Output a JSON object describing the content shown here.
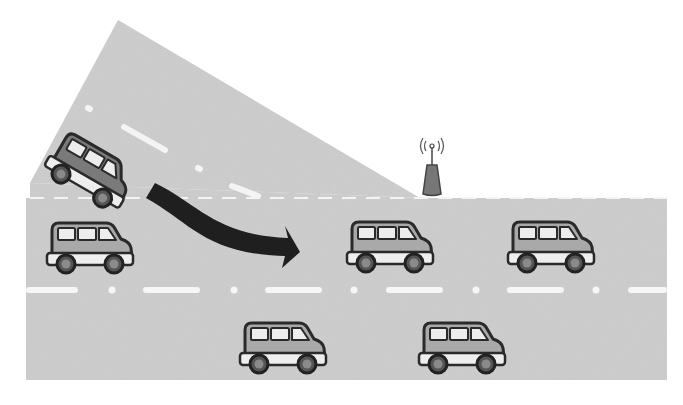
{
  "diagram": {
    "colors": {
      "background": "#ffffff",
      "road": "#cfcfcf",
      "lane_marking": "#f4f4f4",
      "car_body": "#a9a9a9",
      "merging_car_body": "#7a7a7a",
      "car_outline": "#2a2a2a",
      "car_window": "#ededed",
      "car_bumper": "#eeeeee",
      "wheel": "#555555",
      "arrow": "#1f1f1f",
      "antenna_base": "#777777"
    },
    "elements": {
      "highway": {
        "label": "highway",
        "x": 26,
        "y": 198,
        "width": 641,
        "height": 182
      },
      "ramp": {
        "label": "on-ramp",
        "points": "118,20 420,198 30,183"
      },
      "roadside_unit": {
        "label": "roadside unit with antenna",
        "x": 430,
        "y": 172
      },
      "merge_arrow": {
        "label": "merge direction arrow"
      },
      "merging_car": {
        "label": "merging vehicle",
        "x": 106,
        "y": 158,
        "angle": 30
      },
      "cars": [
        {
          "label": "vehicle-lane1-a",
          "x": 46,
          "y": 220
        },
        {
          "label": "vehicle-lane1-b",
          "x": 345,
          "y": 219
        },
        {
          "label": "vehicle-lane1-c",
          "x": 505,
          "y": 219
        },
        {
          "label": "vehicle-lane2-a",
          "x": 237,
          "y": 320
        },
        {
          "label": "vehicle-lane2-b",
          "x": 416,
          "y": 320
        }
      ]
    }
  }
}
